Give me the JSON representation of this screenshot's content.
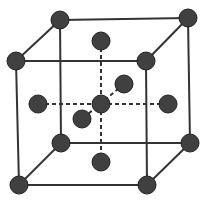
{
  "diagram": {
    "type": "crystal-lattice-cube",
    "colors": {
      "edge": "#333333",
      "atom_fill": "#404040",
      "atom_stroke": "#222222",
      "background": "#ffffff"
    },
    "atom_radius": 9,
    "atoms": [
      {
        "id": "back-top-left",
        "x": 60,
        "y": 20
      },
      {
        "id": "back-top-right",
        "x": 188,
        "y": 18
      },
      {
        "id": "front-top-left",
        "x": 16,
        "y": 61
      },
      {
        "id": "front-top-right",
        "x": 146,
        "y": 61
      },
      {
        "id": "back-bottom-left",
        "x": 61,
        "y": 143
      },
      {
        "id": "back-bottom-right",
        "x": 190,
        "y": 143
      },
      {
        "id": "front-bottom-left",
        "x": 19,
        "y": 185
      },
      {
        "id": "front-bottom-right",
        "x": 147,
        "y": 185
      },
      {
        "id": "center",
        "x": 101,
        "y": 104
      },
      {
        "id": "top-face",
        "x": 101,
        "y": 41
      },
      {
        "id": "bottom-face",
        "x": 101,
        "y": 162
      },
      {
        "id": "left-face",
        "x": 38,
        "y": 104
      },
      {
        "id": "right-face",
        "x": 168,
        "y": 104
      },
      {
        "id": "back-face",
        "x": 124,
        "y": 84
      },
      {
        "id": "front-face",
        "x": 82,
        "y": 119
      }
    ],
    "edges": [
      [
        "back-top-left",
        "back-top-right"
      ],
      [
        "front-top-left",
        "front-top-right"
      ],
      [
        "back-top-left",
        "front-top-left"
      ],
      [
        "back-top-right",
        "front-top-right"
      ],
      [
        "back-bottom-left",
        "back-bottom-right"
      ],
      [
        "front-bottom-left",
        "front-bottom-right"
      ],
      [
        "back-bottom-left",
        "front-bottom-left"
      ],
      [
        "back-bottom-right",
        "front-bottom-right"
      ],
      [
        "back-top-left",
        "back-bottom-left"
      ],
      [
        "back-top-right",
        "back-bottom-right"
      ],
      [
        "front-top-left",
        "front-bottom-left"
      ],
      [
        "front-top-right",
        "front-bottom-right"
      ]
    ],
    "dashed_edges": [
      [
        "top-face",
        "bottom-face"
      ],
      [
        "left-face",
        "right-face"
      ],
      [
        "back-face",
        "front-face"
      ]
    ]
  }
}
